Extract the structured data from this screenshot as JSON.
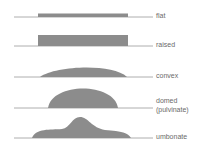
{
  "colors": {
    "shape": "#8c8c8c",
    "baseline": "#999999",
    "label": "#6a6a6a"
  },
  "forms": [
    {
      "id": "flat",
      "label": "flat"
    },
    {
      "id": "raised",
      "label": "raised"
    },
    {
      "id": "convex",
      "label": "convex"
    },
    {
      "id": "domed",
      "label": "domed",
      "sublabel": "(pulvinate)"
    },
    {
      "id": "umbonate",
      "label": "umbonate"
    }
  ]
}
